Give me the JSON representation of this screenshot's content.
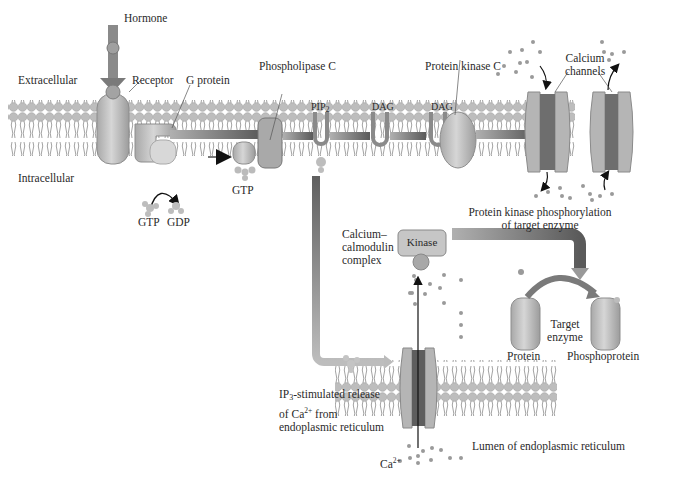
{
  "diagram": {
    "type": "signaling-pathway",
    "regions": {
      "extracellular": "Extracellular",
      "intracellular": "Intracellular",
      "er_lumen": "Lumen of endoplasmic reticulum"
    },
    "labels": {
      "hormone": "Hormone",
      "receptor": "Receptor",
      "g_protein": "G protein",
      "phospholipase_c": "Phospholipase C",
      "pip2": "PIP",
      "pip2_sub": "2",
      "dag_1": "DAG",
      "dag_2": "DAG",
      "protein_kinase_c": "Protein kinase C",
      "calcium_channels_line1": "Calcium",
      "calcium_channels_line2": "channels",
      "gtp_1": "GTP",
      "gdp": "GDP",
      "gtp_2": "GTP",
      "pk_phos_line1": "Protein kinase phosphorylation",
      "pk_phos_line2": "of target enzyme",
      "cam_line1": "Calcium–",
      "cam_line2": "calmodulin",
      "cam_line3": "complex",
      "kinase": "Kinase",
      "target_line1": "Target",
      "target_line2": "enzyme",
      "protein": "Protein",
      "phosphoprotein": "Phosphoprotein",
      "ip3_line1_pre": "IP",
      "ip3_sub": "3",
      "ip3_line1_post": "-stimulated release",
      "ip3_line2_pre": "of Ca",
      "ip3_line2_sup": "2+",
      "ip3_line2_post": " from",
      "ip3_line3": "endoplasmic reticulum",
      "ca_pre": "Ca",
      "ca_sup": "2+"
    },
    "colors": {
      "membrane_head": "#b9b9b9",
      "protein_fill": "#c4c4c4",
      "arrow_dark": "#6a6a6a",
      "channel_core": "#6e6e6e",
      "ion_dot": "#9a9a9a"
    }
  }
}
